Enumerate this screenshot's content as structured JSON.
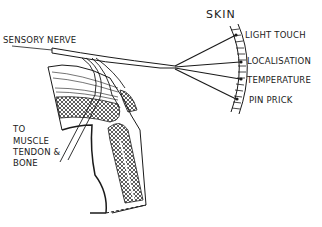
{
  "diagram": {
    "colors": {
      "ink": "#1a1a1a",
      "background": "#ffffff"
    },
    "labels": {
      "sensory_nerve": "SENSORY NERVE",
      "skin": "SKIN",
      "light_touch": "LIGHT TOUCH",
      "localisation": "LOCALISATION",
      "temperature": "TEMPERATURE",
      "pin_prick": "PIN PRICK",
      "to": "TO",
      "muscle": "MUSCLE",
      "tendon": "TENDON &",
      "bone": "BONE"
    }
  }
}
